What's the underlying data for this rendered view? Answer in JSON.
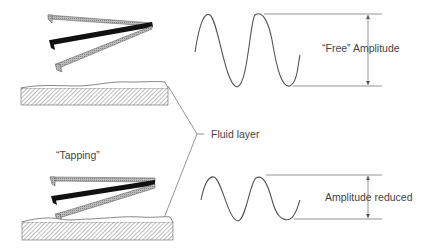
{
  "labels": {
    "free_amplitude": "“Free” Amplitude",
    "fluid_layer": "Fluid layer",
    "tapping": "“Tapping”",
    "amplitude_reduced": "Amplitude reduced"
  },
  "colors": {
    "line": "#555555",
    "hatch": "#777777",
    "cantilever_dark": "#111111",
    "cantilever_light": "#aaaaaa"
  }
}
